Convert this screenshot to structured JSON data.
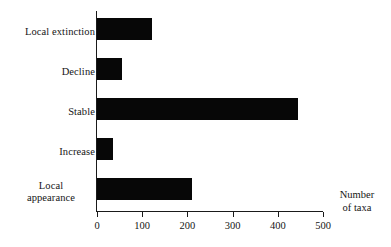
{
  "chart_data": {
    "type": "bar",
    "orientation": "horizontal",
    "title": "",
    "subtitle": "",
    "xlabel": "Number\nof taxa",
    "ylabel": "",
    "categories": [
      "Local extinction",
      "Decline",
      "Stable",
      "Increase",
      "Local\nappearance"
    ],
    "values": [
      122,
      56,
      444,
      36,
      211
    ],
    "series": [
      {
        "name": "Number of taxa",
        "values": [
          122,
          56,
          444,
          36,
          211
        ],
        "color": "#070707"
      }
    ],
    "xlim": [
      0,
      500
    ],
    "xticks": [
      0,
      100,
      200,
      300,
      400,
      500
    ],
    "xtick_labels": [
      "0",
      "100",
      "200",
      "300",
      "400",
      "500"
    ],
    "grid": false,
    "legend": false,
    "legend_position": "none",
    "bar_color": "#070707",
    "axis_color": "#1a1a1a",
    "background_color": "#ffffff"
  },
  "chart": {
    "axis_title": "Number\nof taxa",
    "categories": [
      {
        "label": "Local extinction",
        "value": 122,
        "multiline": false
      },
      {
        "label": "Decline",
        "value": 56,
        "multiline": false
      },
      {
        "label": "Stable",
        "value": 444,
        "multiline": false
      },
      {
        "label": "Increase",
        "value": 36,
        "multiline": false
      },
      {
        "label": "Local\nappearance",
        "value": 211,
        "multiline": true
      }
    ],
    "ticks": [
      {
        "label": "0",
        "value": 0
      },
      {
        "label": "100",
        "value": 100
      },
      {
        "label": "200",
        "value": 200
      },
      {
        "label": "300",
        "value": 300
      },
      {
        "label": "400",
        "value": 400
      },
      {
        "label": "500",
        "value": 500
      }
    ]
  }
}
